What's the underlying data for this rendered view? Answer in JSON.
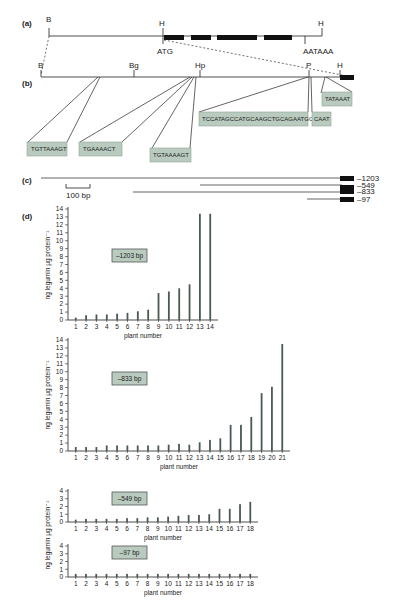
{
  "panels": {
    "a": {
      "label": "(a)",
      "sites": [
        {
          "name": "B"
        },
        {
          "name": "H"
        },
        {
          "name": "H"
        }
      ],
      "start_codon": "ATG",
      "polyA_signal": "AATAAA"
    },
    "b": {
      "label": "(b)",
      "sites": [
        {
          "name": "B"
        },
        {
          "name": "Bg"
        },
        {
          "name": "Hp"
        },
        {
          "name": "P"
        },
        {
          "name": "H"
        }
      ],
      "sequence_boxes": [
        {
          "text": "TGTTAAAGT"
        },
        {
          "text": "TGAAAACT"
        },
        {
          "text": "TGTAAAAGT"
        },
        {
          "text": "TCCATAGCCATGCAAGCTGCAGAATGCT"
        },
        {
          "text": "CAAT"
        },
        {
          "text": "TATAAAT"
        }
      ]
    },
    "c": {
      "label": "(c)",
      "constructs": [
        {
          "label": "–1203"
        },
        {
          "label": "–833"
        },
        {
          "label": "–549"
        },
        {
          "label": "–97"
        }
      ],
      "scale_bar": "100 bp"
    },
    "d": {
      "label": "(d)"
    }
  },
  "chart_data": [
    {
      "type": "bar",
      "title": "–1203 bp",
      "xlabel": "plant number",
      "ylabel": "ng legumin μg protein⁻¹",
      "ylim": [
        0,
        14
      ],
      "yticks": [
        0,
        1,
        2,
        3,
        4,
        5,
        6,
        7,
        8,
        9,
        10,
        11,
        12,
        13,
        14
      ],
      "categories": [
        "1",
        "2",
        "3",
        "4",
        "5",
        "6",
        "7",
        "8",
        "9",
        "10",
        "11",
        "12",
        "13",
        "14"
      ],
      "values": [
        0.3,
        0.6,
        0.7,
        0.7,
        0.8,
        0.9,
        1.1,
        1.3,
        3.4,
        3.6,
        4.0,
        4.5,
        13.4,
        13.4
      ],
      "grid": false
    },
    {
      "type": "bar",
      "title": "–833 bp",
      "xlabel": "plant number",
      "ylabel": "ng legumin μg protein⁻¹",
      "ylim": [
        0,
        14
      ],
      "yticks": [
        0,
        1,
        2,
        3,
        4,
        5,
        6,
        7,
        8,
        9,
        10,
        11,
        12,
        13,
        14
      ],
      "categories": [
        "1",
        "2",
        "3",
        "4",
        "5",
        "6",
        "7",
        "8",
        "9",
        "10",
        "11",
        "12",
        "13",
        "14",
        "15",
        "16",
        "17",
        "18",
        "19",
        "20",
        "21"
      ],
      "values": [
        0.5,
        0.5,
        0.5,
        0.7,
        0.7,
        0.7,
        0.7,
        0.7,
        0.7,
        0.8,
        0.9,
        0.8,
        1.1,
        1.4,
        1.6,
        3.3,
        3.3,
        4.3,
        7.3,
        8.1,
        13.5
      ],
      "grid": false
    },
    {
      "type": "bar",
      "title": "–549 bp",
      "xlabel": "plant number",
      "ylabel": "ng legumin μg protein⁻¹",
      "ylim": [
        0,
        4
      ],
      "yticks": [
        0,
        1,
        2,
        3,
        4
      ],
      "categories": [
        "1",
        "2",
        "3",
        "4",
        "5",
        "6",
        "7",
        "8",
        "9",
        "10",
        "11",
        "12",
        "13",
        "14",
        "15",
        "16",
        "17",
        "18"
      ],
      "values": [
        0.3,
        0.4,
        0.4,
        0.4,
        0.4,
        0.5,
        0.5,
        0.6,
        0.6,
        0.7,
        0.8,
        0.9,
        0.9,
        1.0,
        1.7,
        1.7,
        2.3,
        2.6
      ],
      "grid": false
    },
    {
      "type": "bar",
      "title": "–97 bp",
      "xlabel": "plant number",
      "ylabel": "ng legumin μg protein⁻¹",
      "ylim": [
        0,
        4
      ],
      "yticks": [
        0,
        1,
        2,
        3,
        4
      ],
      "categories": [
        "1",
        "2",
        "3",
        "4",
        "5",
        "6",
        "7",
        "8",
        "9",
        "10",
        "11",
        "12",
        "13",
        "14",
        "15",
        "16",
        "17",
        "18"
      ],
      "values": [
        0.4,
        0.4,
        0.4,
        0.4,
        0.4,
        0.4,
        0.4,
        0.4,
        0.4,
        0.4,
        0.4,
        0.4,
        0.4,
        0.4,
        0.4,
        0.4,
        0.4,
        0.4
      ],
      "grid": false
    }
  ]
}
